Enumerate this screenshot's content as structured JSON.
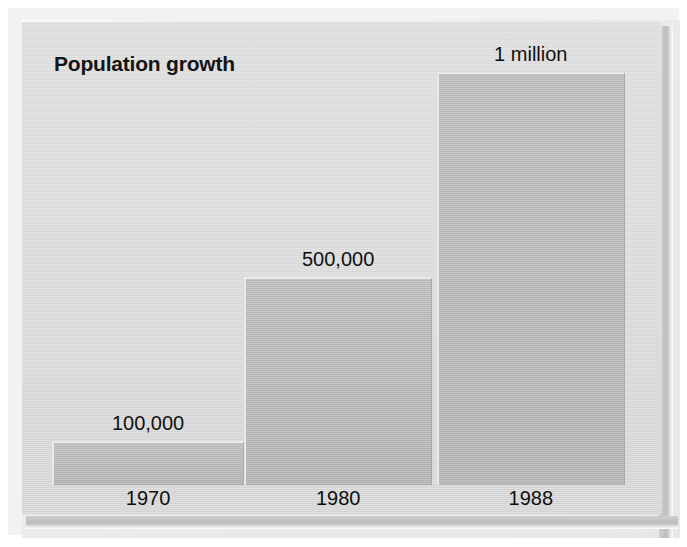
{
  "chart_data": {
    "type": "bar",
    "title": "Population growth",
    "xlabel": "",
    "ylabel": "",
    "categories": [
      "1970",
      "1980",
      "1988"
    ],
    "values": [
      100000,
      500000,
      1000000
    ],
    "value_labels": [
      "100,000",
      "500,000",
      "1 million"
    ],
    "series": [
      {
        "name": "Population",
        "values": [
          100000,
          500000,
          1000000
        ]
      }
    ],
    "ylim": [
      0,
      1000000
    ],
    "grid": false,
    "legend": false,
    "legend_position": "none",
    "bar_gap": 0,
    "value_label_position": "above-bar",
    "bars": [
      {
        "category": "1970",
        "value": 100000,
        "label": "100,000",
        "left_pct": 4.7,
        "width_pct": 30.0,
        "height_pct": 9.5
      },
      {
        "category": "1980",
        "value": 500000,
        "label": "500,000",
        "left_pct": 34.7,
        "width_pct": 29.4,
        "height_pct": 44.9
      },
      {
        "category": "1988",
        "value": 1000000,
        "label": "1 million",
        "left_pct": 64.8,
        "width_pct": 29.4,
        "height_pct": 89.2
      }
    ],
    "axis_ticks": [
      {
        "label": "1970",
        "center_pct": 19.7
      },
      {
        "label": "1980",
        "center_pct": 49.4
      },
      {
        "label": "1988",
        "center_pct": 79.5
      }
    ],
    "value_label_positions": [
      {
        "label": "100,000",
        "center_pct": 19.7,
        "bottom_pct": 10.8
      },
      {
        "label": "500,000",
        "center_pct": 49.4,
        "bottom_pct": 46.2
      },
      {
        "label": "1 million",
        "center_pct": 79.5,
        "bottom_pct": 90.5
      }
    ]
  },
  "colors": {
    "panel_background": "#dadada",
    "bar_fill": "#b9b9b9",
    "bar_border_light": "#e9e9e9",
    "bar_border_dark": "#a9a9a9",
    "text": "#111111",
    "frame": "#ededed"
  }
}
